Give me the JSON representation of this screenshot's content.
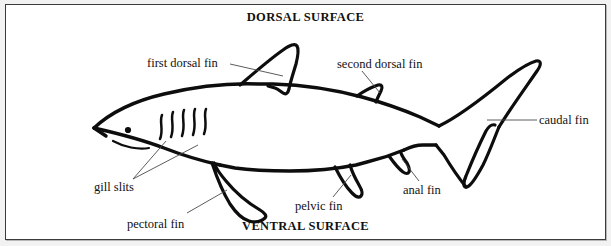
{
  "figure": {
    "style": "black-and-white line drawing with leader-line callouts",
    "background_color": "#ffffff",
    "border_color": "#3a3a3a",
    "ink_color": "#0d0d0d",
    "leader_color": "#4a4a4a"
  },
  "surface_labels": {
    "dorsal": "DORSAL SURFACE",
    "ventral": "VENTRAL SURFACE"
  },
  "parts": [
    {
      "key": "first_dorsal_fin",
      "label": "first dorsal fin"
    },
    {
      "key": "second_dorsal_fin",
      "label": "second dorsal fin"
    },
    {
      "key": "caudal_fin",
      "label": "caudal fin"
    },
    {
      "key": "gill_slits",
      "label": "gill slits"
    },
    {
      "key": "pectoral_fin",
      "label": "pectoral fin"
    },
    {
      "key": "pelvic_fin",
      "label": "pelvic fin"
    },
    {
      "key": "anal_fin",
      "label": "anal fin"
    }
  ],
  "anatomy_counts": {
    "gill_slits": 5
  }
}
